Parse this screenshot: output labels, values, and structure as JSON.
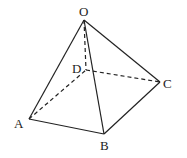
{
  "diagram": {
    "type": "square pyramid",
    "vertices": {
      "O": {
        "label": "O",
        "x": 84,
        "y": 20
      },
      "A": {
        "label": "A",
        "x": 29,
        "y": 119
      },
      "B": {
        "label": "B",
        "x": 104,
        "y": 134
      },
      "C": {
        "label": "C",
        "x": 160,
        "y": 82
      },
      "D": {
        "label": "D",
        "x": 86,
        "y": 70
      }
    },
    "solid_edges": [
      "OA",
      "OB",
      "OC",
      "AB",
      "BC"
    ],
    "dashed_edges": [
      "OD",
      "AD",
      "DC"
    ],
    "line_color": "#222222"
  }
}
